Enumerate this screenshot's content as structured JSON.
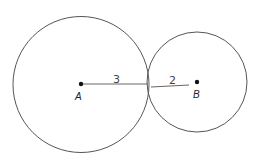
{
  "diagram": {
    "circles": [
      {
        "id": "A",
        "cx": 81,
        "cy": 84,
        "r": 68,
        "radius_label": "3"
      },
      {
        "id": "B",
        "cx": 197,
        "cy": 82,
        "r": 50,
        "radius_label": "2"
      }
    ],
    "points": [
      {
        "label": "A",
        "x": 81,
        "y": 84
      },
      {
        "label": "B",
        "x": 197,
        "y": 82
      }
    ],
    "segments": [
      {
        "from": "A",
        "to": "tangent-point",
        "label": "3"
      },
      {
        "from": "tangent-point",
        "to": "B",
        "label": "2"
      }
    ],
    "colors": {
      "stroke": "#555555",
      "dot": "#111111",
      "background": "#ffffff"
    }
  },
  "labels": {
    "point_a": "A",
    "point_b": "B",
    "radius_a": "3",
    "radius_b": "2"
  }
}
